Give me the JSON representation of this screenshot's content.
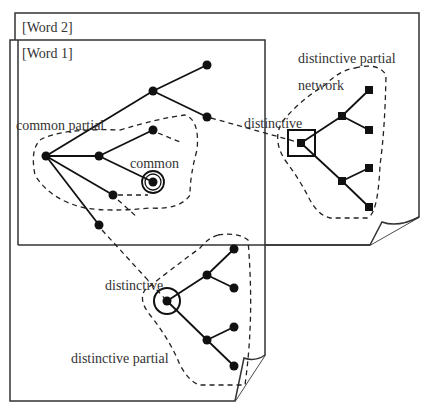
{
  "diagram": {
    "pages": [
      {
        "id": "word2",
        "label": "[Word 2]"
      },
      {
        "id": "word1",
        "label": "[Word 1]"
      }
    ],
    "labels": {
      "common_partial": "common partial",
      "common": "common",
      "distinctive_upper": "distinctive",
      "distinctive_partial_network_line1": "distinctive partial",
      "distinctive_partial_network_line2": "network",
      "distinctive_lower": "distinctive",
      "distinctive_partial_lower": "distinctive partial"
    }
  }
}
